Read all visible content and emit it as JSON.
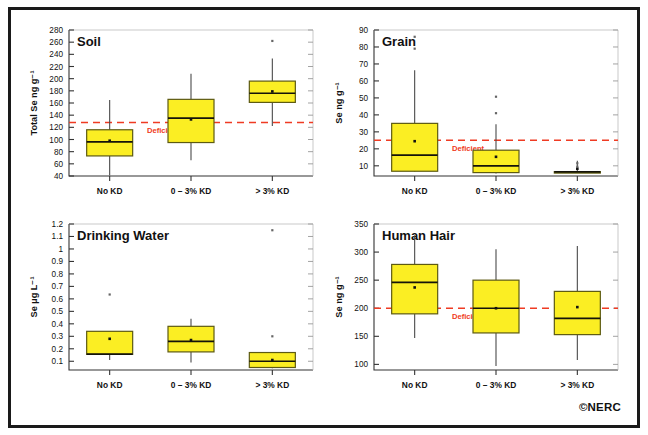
{
  "figure": {
    "credit": "©NERC",
    "categories": [
      "No KD",
      "0 – 3% KD",
      "> 3% KD"
    ],
    "deficient_label": "Deficient"
  },
  "chart_data": [
    {
      "type": "box",
      "title": "Soil",
      "xlabel": "",
      "ylabel": "Total Se ng g⁻¹",
      "ylim": [
        40,
        280
      ],
      "yticks": [
        40,
        60,
        80,
        100,
        120,
        140,
        160,
        180,
        200,
        220,
        240,
        260,
        280
      ],
      "grid": false,
      "legend": "none",
      "reference_line": {
        "value": 128,
        "label": "Deficient",
        "color": "#ef3b23",
        "style": "dashed"
      },
      "categories": [
        "No KD",
        "0 – 3% KD",
        "> 3% KD"
      ],
      "boxes": [
        {
          "category": "No KD",
          "whisker_low": 41,
          "q1": 73,
          "median": 96,
          "q3": 116,
          "whisker_high": 165,
          "mean": 98,
          "outliers": []
        },
        {
          "category": "0 – 3% KD",
          "whisker_low": 66,
          "q1": 95,
          "median": 135,
          "q3": 166,
          "whisker_high": 208,
          "mean": 133,
          "outliers": []
        },
        {
          "category": "> 3% KD",
          "whisker_low": 122,
          "q1": 161,
          "median": 176,
          "q3": 196,
          "whisker_high": 233,
          "mean": 179,
          "outliers": [
            262
          ]
        }
      ]
    },
    {
      "type": "box",
      "title": "Grain",
      "xlabel": "",
      "ylabel": "Se ng g⁻¹",
      "ylim": [
        4,
        90
      ],
      "yticks": [
        10,
        20,
        30,
        40,
        50,
        60,
        70,
        80,
        90
      ],
      "grid": false,
      "legend": "none",
      "reference_line": {
        "value": 25,
        "label": "Deficient",
        "color": "#ef3b23",
        "style": "dashed"
      },
      "categories": [
        "No KD",
        "0 – 3% KD",
        "> 3% KD"
      ],
      "boxes": [
        {
          "category": "No KD",
          "whisker_low": 6.5,
          "q1": 6.8,
          "median": 16.3,
          "q3": 35.0,
          "whisker_high": 66.3,
          "mean": 24.5,
          "outliers": [
            79,
            86
          ]
        },
        {
          "category": "0 – 3% KD",
          "whisker_low": 5.5,
          "q1": 6.0,
          "median": 10.0,
          "q3": 19.2,
          "whisker_high": 34.5,
          "mean": 15.3,
          "outliers": [
            41,
            50.7
          ]
        },
        {
          "category": "> 3% KD",
          "whisker_low": 6.3,
          "q1": 6.3,
          "median": 6.4,
          "q3": 6.6,
          "whisker_high": 13.0,
          "mean": 8.3,
          "outliers": [
            9.5,
            11.5
          ]
        }
      ]
    },
    {
      "type": "box",
      "title": "Drinking Water",
      "xlabel": "",
      "ylabel": "Se µg L⁻¹",
      "ylim": [
        0.03,
        1.2
      ],
      "yticks": [
        0.1,
        0.2,
        0.3,
        0.4,
        0.5,
        0.6,
        0.7,
        0.8,
        0.9,
        1.0,
        1.1,
        1.2
      ],
      "ytick_labels": [
        "0.1",
        "0.2",
        "0.3",
        "0.4",
        "0.5",
        "0.6",
        "0.7",
        "0.8",
        "0.9",
        "1",
        "1.1",
        "1.2"
      ],
      "grid": false,
      "legend": "none",
      "reference_line": null,
      "categories": [
        "No KD",
        "0 – 3% KD",
        "> 3% KD"
      ],
      "boxes": [
        {
          "category": "No KD",
          "whisker_low": 0.11,
          "q1": 0.155,
          "median": 0.157,
          "q3": 0.34,
          "whisker_high": 0.34,
          "mean": 0.28,
          "outliers": [
            0.635
          ]
        },
        {
          "category": "0 – 3% KD",
          "whisker_low": 0.09,
          "q1": 0.175,
          "median": 0.26,
          "q3": 0.38,
          "whisker_high": 0.44,
          "mean": 0.27,
          "outliers": []
        },
        {
          "category": "> 3% KD",
          "whisker_low": 0.045,
          "q1": 0.05,
          "median": 0.1,
          "q3": 0.17,
          "whisker_high": 0.17,
          "mean": 0.11,
          "outliers": [
            0.3,
            1.15
          ]
        }
      ]
    },
    {
      "type": "box",
      "title": "Human Hair",
      "xlabel": "",
      "ylabel": "Se ng g⁻¹",
      "ylim": [
        90,
        350
      ],
      "yticks": [
        100,
        150,
        200,
        250,
        300,
        350
      ],
      "grid": false,
      "legend": "none",
      "reference_line": {
        "value": 200,
        "label": "Deficient",
        "color": "#ef3b23",
        "style": "dashed"
      },
      "categories": [
        "No KD",
        "0 – 3% KD",
        "> 3% KD"
      ],
      "boxes": [
        {
          "category": "No KD",
          "whisker_low": 147,
          "q1": 190,
          "median": 246,
          "q3": 278,
          "whisker_high": 330,
          "mean": 237,
          "outliers": []
        },
        {
          "category": "0 – 3% KD",
          "whisker_low": 97,
          "q1": 156,
          "median": 200,
          "q3": 250,
          "whisker_high": 305,
          "mean": 200,
          "outliers": []
        },
        {
          "category": "> 3% KD",
          "whisker_low": 108,
          "q1": 153,
          "median": 182,
          "q3": 230,
          "whisker_high": 311,
          "mean": 202,
          "outliers": []
        }
      ]
    }
  ]
}
